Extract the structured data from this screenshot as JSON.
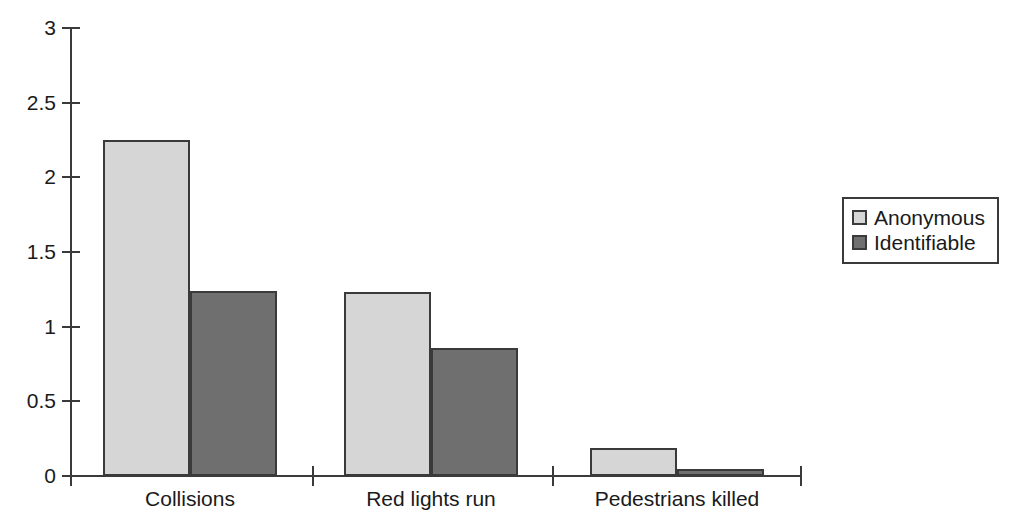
{
  "chart_data": {
    "type": "bar",
    "title": "",
    "subtitle": "",
    "xlabel": "",
    "ylabel": "",
    "categories": [
      "Collisions",
      "Red lights run",
      "Pedestrians killed"
    ],
    "series": [
      {
        "name": "Anonymous",
        "values": [
          2.25,
          1.23,
          0.19
        ],
        "color": "#d6d6d6"
      },
      {
        "name": "Identifiable",
        "values": [
          1.24,
          0.86,
          0.05
        ],
        "color": "#6f6f6f"
      }
    ],
    "ylim": [
      0,
      3
    ],
    "yticks": [
      0,
      0.5,
      1,
      1.5,
      2,
      2.5,
      3
    ],
    "ytick_labels": [
      "0",
      "0.5",
      "1",
      "1.5",
      "2",
      "2.5",
      "3"
    ],
    "grid": false,
    "legend_position": "right",
    "axis_color": "#3a3a3a",
    "background": "#ffffff"
  },
  "legend": {
    "entries": [
      {
        "label": "Anonymous"
      },
      {
        "label": "Identifiable"
      }
    ]
  },
  "axes": {
    "x_tick_labels": [
      "Collisions",
      "Red lights run",
      "Pedestrians killed"
    ],
    "y_tick_labels": [
      "3",
      "2.5",
      "2",
      "1.5",
      "1",
      "0.5",
      "0"
    ]
  }
}
